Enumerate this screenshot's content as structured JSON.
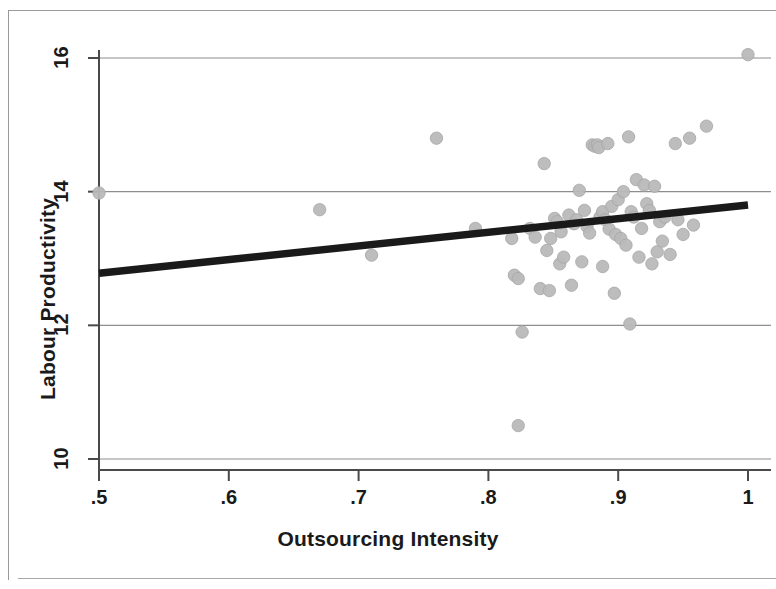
{
  "chart_data": {
    "type": "scatter",
    "title": "",
    "xlabel": "Outsourcing Intensity",
    "ylabel": "Labour Productivity",
    "xlim": [
      0.47,
      1.02
    ],
    "ylim": [
      9.85,
      16.35
    ],
    "xticks": [
      ".5",
      ".6",
      ".7",
      ".8",
      ".9",
      "1"
    ],
    "xtick_values": [
      0.5,
      0.6,
      0.7,
      0.8,
      0.9,
      1.0
    ],
    "yticks": [
      "10",
      "12",
      "14",
      "16"
    ],
    "ytick_values": [
      10,
      12,
      14,
      16
    ],
    "grid": "horizontal",
    "legend": "none",
    "marker_color": "#b9b9b9",
    "marker_edge_color": "#a6a6a6",
    "fit_line_color": "#1a1a1a",
    "grid_color": "#8e8e8e",
    "axis_color": "#4a4a4a",
    "series": [
      {
        "name": "Firms",
        "points": [
          [
            0.5,
            13.98
          ],
          [
            0.67,
            13.73
          ],
          [
            0.71,
            13.05
          ],
          [
            0.76,
            14.8
          ],
          [
            0.79,
            13.45
          ],
          [
            0.818,
            13.3
          ],
          [
            0.82,
            12.75
          ],
          [
            0.823,
            12.7
          ],
          [
            0.823,
            10.5
          ],
          [
            0.826,
            11.9
          ],
          [
            0.832,
            13.45
          ],
          [
            0.836,
            13.32
          ],
          [
            0.84,
            12.55
          ],
          [
            0.843,
            14.42
          ],
          [
            0.845,
            13.12
          ],
          [
            0.847,
            12.52
          ],
          [
            0.848,
            13.3
          ],
          [
            0.851,
            13.6
          ],
          [
            0.853,
            13.55
          ],
          [
            0.855,
            12.92
          ],
          [
            0.856,
            13.4
          ],
          [
            0.858,
            13.02
          ],
          [
            0.862,
            13.65
          ],
          [
            0.864,
            12.6
          ],
          [
            0.866,
            13.52
          ],
          [
            0.868,
            13.58
          ],
          [
            0.87,
            14.02
          ],
          [
            0.872,
            12.95
          ],
          [
            0.874,
            13.72
          ],
          [
            0.876,
            13.48
          ],
          [
            0.878,
            13.38
          ],
          [
            0.88,
            14.7
          ],
          [
            0.882,
            14.68
          ],
          [
            0.884,
            14.7
          ],
          [
            0.885,
            14.66
          ],
          [
            0.886,
            13.62
          ],
          [
            0.888,
            13.7
          ],
          [
            0.888,
            12.88
          ],
          [
            0.89,
            13.58
          ],
          [
            0.892,
            14.72
          ],
          [
            0.893,
            13.44
          ],
          [
            0.895,
            13.78
          ],
          [
            0.897,
            12.48
          ],
          [
            0.898,
            13.36
          ],
          [
            0.9,
            13.88
          ],
          [
            0.902,
            13.3
          ],
          [
            0.904,
            14.0
          ],
          [
            0.906,
            13.2
          ],
          [
            0.908,
            14.82
          ],
          [
            0.909,
            12.02
          ],
          [
            0.91,
            13.7
          ],
          [
            0.912,
            13.62
          ],
          [
            0.914,
            14.18
          ],
          [
            0.916,
            13.02
          ],
          [
            0.918,
            13.45
          ],
          [
            0.92,
            14.1
          ],
          [
            0.922,
            13.82
          ],
          [
            0.924,
            13.72
          ],
          [
            0.926,
            12.92
          ],
          [
            0.928,
            14.08
          ],
          [
            0.93,
            13.1
          ],
          [
            0.932,
            13.55
          ],
          [
            0.934,
            13.26
          ],
          [
            0.936,
            13.62
          ],
          [
            0.94,
            13.06
          ],
          [
            0.944,
            14.72
          ],
          [
            0.946,
            13.58
          ],
          [
            0.95,
            13.36
          ],
          [
            0.955,
            14.8
          ],
          [
            0.958,
            13.5
          ],
          [
            0.968,
            14.98
          ],
          [
            1.0,
            16.05
          ]
        ]
      }
    ],
    "fit_line": {
      "name": "Linear fit",
      "x_start": 0.5,
      "y_start": 12.78,
      "x_end": 1.0,
      "y_end": 13.8
    }
  }
}
